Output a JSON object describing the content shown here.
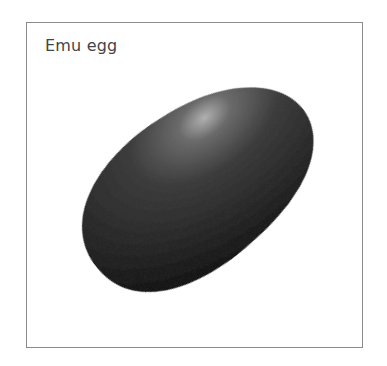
{
  "figure": {
    "title": "Emu egg",
    "colors": {
      "egg_dark": "#161616",
      "egg_mid": "#3a3a3a",
      "highlight": "#a8a8a8",
      "border": "#8a8a8a",
      "text": "#444444"
    }
  }
}
